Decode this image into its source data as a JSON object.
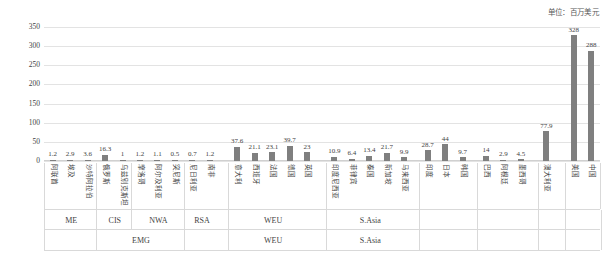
{
  "caption": {
    "unit": "单位：百万美元"
  },
  "colors": {
    "bar": "#7f7f7f",
    "grid": "#e3e3e3",
    "text": "#3f3f3f",
    "border": "#d9d9d9"
  },
  "axis": {
    "y_ticks": [
      "0",
      "50",
      "100",
      "150",
      "200",
      "250",
      "300",
      "350"
    ],
    "y_min": 0,
    "y_max": 350
  },
  "groups_row1": [
    {
      "label": "ME",
      "start": 0,
      "count": 3
    },
    {
      "label": "CIS",
      "start": 3,
      "count": 2
    },
    {
      "label": "NWA",
      "start": 5,
      "count": 3
    },
    {
      "label": "RSA",
      "start": 8,
      "count": 2
    },
    {
      "label": "WEU",
      "start": 10,
      "count": 5
    },
    {
      "label": "S.Asia",
      "start": 15,
      "count": 5
    },
    {
      "label": "",
      "start": 20,
      "count": 3
    },
    {
      "label": "",
      "start": 23,
      "count": 3
    },
    {
      "label": "",
      "start": 26,
      "count": 1
    },
    {
      "label": "",
      "start": 27,
      "count": 2
    }
  ],
  "groups_row2": [
    {
      "label": "",
      "start": 0,
      "count": 3
    },
    {
      "label": "EMG",
      "start": 3,
      "count": 5
    },
    {
      "label": "",
      "start": 8,
      "count": 2
    },
    {
      "label": "WEU",
      "start": 10,
      "count": 5
    },
    {
      "label": "S.Asia",
      "start": 15,
      "count": 5
    },
    {
      "label": "",
      "start": 20,
      "count": 3
    },
    {
      "label": "",
      "start": 23,
      "count": 3
    },
    {
      "label": "",
      "start": 26,
      "count": 1
    },
    {
      "label": "",
      "start": 27,
      "count": 2
    }
  ],
  "chart_data": {
    "type": "bar",
    "title": "",
    "subtitle": "",
    "xlabel": "",
    "ylabel": "",
    "ylim": [
      0,
      350
    ],
    "grid": true,
    "legend": false,
    "unit": "百万美元",
    "categories": [
      "阿联酋",
      "埃及",
      "沙特阿拉伯",
      "俄罗斯",
      "乌兹别克斯坦",
      "摩洛哥",
      "阿尔及利亚",
      "突尼斯",
      "尼日利亚",
      "南非",
      "意大利",
      "西班牙",
      "法国",
      "德国",
      "英国",
      "印度尼西亚",
      "菲律宾",
      "泰国",
      "新加坡",
      "马来西亚",
      "印度",
      "日本",
      "韩国",
      "巴西",
      "阿根廷",
      "墨西哥",
      "澳大利亚",
      "美国",
      "中国"
    ],
    "values": [
      1.2,
      2.9,
      3.6,
      16.3,
      1,
      1.2,
      1.1,
      0.5,
      0.7,
      1.2,
      37.6,
      21.1,
      23.1,
      39.7,
      23,
      10.9,
      6.4,
      13.4,
      21.7,
      9.9,
      28.7,
      44,
      9.7,
      14,
      2.9,
      4.5,
      77.9,
      328,
      288
    ],
    "value_labels": [
      "1.2",
      "2.9",
      "3.6",
      "16.3",
      "1",
      "1.2",
      "1.1",
      "0.5",
      "0.7",
      "1.2",
      "37.6",
      "21.1",
      "23.1",
      "39.7",
      "23",
      "10.9",
      "6.4",
      "13.4",
      "21.7",
      "9.9",
      "28.7",
      "44",
      "9.7",
      "14",
      "2.9",
      "4.5",
      "77.9",
      "328",
      "288"
    ]
  }
}
